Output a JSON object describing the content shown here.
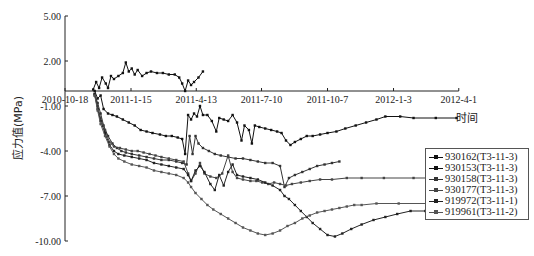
{
  "chart_data": {
    "type": "line",
    "title": "",
    "xlabel": "时间",
    "ylabel": "应力值(MPa)",
    "ylim": [
      -10,
      5
    ],
    "y_ticks": [
      "5.00",
      "2.00",
      "-1.00",
      "-4.00",
      "-7.00",
      "-10.00"
    ],
    "y_tick_values": [
      5,
      2,
      -1,
      -4,
      -7,
      -10
    ],
    "x_tick_labels": [
      "2010-10-18",
      "2011-1-15",
      "2011-4-13",
      "2011-7-10",
      "2011-10-7",
      "2012-1-3",
      "2012-4-1"
    ],
    "x_tick_days": [
      0,
      89,
      177,
      265,
      354,
      443,
      531
    ],
    "x_unit": "days since 2010-10-18",
    "grid": false,
    "legend_position": "right",
    "series": [
      {
        "name": "930162(T3-11-3)",
        "color": "#111111",
        "points": [
          [
            38,
            0.1
          ],
          [
            42,
            0.6
          ],
          [
            46,
            0.2
          ],
          [
            50,
            0.9
          ],
          [
            55,
            0.5
          ],
          [
            58,
            0.2
          ],
          [
            62,
            1.0
          ],
          [
            66,
            0.8
          ],
          [
            72,
            1.0
          ],
          [
            78,
            1.2
          ],
          [
            82,
            1.9
          ],
          [
            86,
            1.3
          ],
          [
            90,
            1.5
          ],
          [
            94,
            1.1
          ],
          [
            98,
            1.4
          ],
          [
            104,
            1.0
          ],
          [
            110,
            1.2
          ],
          [
            116,
            1.3
          ],
          [
            124,
            1.2
          ],
          [
            132,
            1.2
          ],
          [
            140,
            1.1
          ],
          [
            148,
            1.1
          ],
          [
            154,
            0.9
          ],
          [
            158,
            0.5
          ],
          [
            162,
            0.0
          ],
          [
            166,
            0.7
          ],
          [
            170,
            0.4
          ],
          [
            174,
            0.6
          ],
          [
            180,
            0.9
          ],
          [
            186,
            1.3
          ]
        ]
      },
      {
        "name": "930153(T3-11-3)",
        "color": "#111111",
        "points": [
          [
            40,
            0.0
          ],
          [
            44,
            -0.5
          ],
          [
            48,
            -0.3
          ],
          [
            52,
            -1.2
          ],
          [
            58,
            -1.5
          ],
          [
            64,
            -1.6
          ],
          [
            70,
            -1.7
          ],
          [
            78,
            -1.9
          ],
          [
            86,
            -2.1
          ],
          [
            94,
            -2.3
          ],
          [
            102,
            -2.6
          ],
          [
            110,
            -2.7
          ],
          [
            118,
            -2.8
          ],
          [
            128,
            -2.9
          ],
          [
            136,
            -3.0
          ],
          [
            144,
            -3.0
          ],
          [
            152,
            -3.1
          ],
          [
            158,
            -3.2
          ],
          [
            162,
            -4.2
          ],
          [
            166,
            -1.6
          ],
          [
            170,
            -1.9
          ],
          [
            174,
            -1.5
          ],
          [
            178,
            -1.7
          ],
          [
            182,
            -1.0
          ],
          [
            186,
            -1.6
          ],
          [
            192,
            -1.6
          ],
          [
            198,
            -2.0
          ],
          [
            204,
            -2.7
          ],
          [
            208,
            -1.8
          ],
          [
            214,
            -1.9
          ],
          [
            220,
            -2.0
          ],
          [
            226,
            -1.6
          ],
          [
            232,
            -2.1
          ],
          [
            238,
            -3.3
          ],
          [
            242,
            -2.3
          ],
          [
            248,
            -2.6
          ],
          [
            252,
            -3.5
          ],
          [
            256,
            -2.3
          ],
          [
            262,
            -2.4
          ],
          [
            270,
            -2.5
          ],
          [
            278,
            -2.6
          ],
          [
            286,
            -2.7
          ],
          [
            292,
            -2.8
          ],
          [
            298,
            -3.3
          ],
          [
            304,
            -3.6
          ],
          [
            310,
            -3.4
          ],
          [
            318,
            -3.2
          ],
          [
            326,
            -3.0
          ],
          [
            334,
            -3.0
          ],
          [
            344,
            -2.9
          ],
          [
            354,
            -2.8
          ],
          [
            366,
            -2.7
          ],
          [
            378,
            -2.5
          ],
          [
            392,
            -2.3
          ],
          [
            406,
            -2.1
          ],
          [
            420,
            -1.9
          ],
          [
            432,
            -1.7
          ],
          [
            452,
            -1.7
          ],
          [
            470,
            -1.8
          ],
          [
            500,
            -1.8
          ],
          [
            528,
            -1.8
          ]
        ]
      },
      {
        "name": "930158(T3-11-3)",
        "color": "#333333",
        "points": [
          [
            40,
            -0.2
          ],
          [
            44,
            -0.8
          ],
          [
            48,
            -1.5
          ],
          [
            52,
            -2.3
          ],
          [
            58,
            -3.0
          ],
          [
            64,
            -3.5
          ],
          [
            70,
            -3.8
          ],
          [
            76,
            -4.0
          ],
          [
            82,
            -4.1
          ],
          [
            90,
            -4.2
          ],
          [
            100,
            -4.3
          ],
          [
            110,
            -4.4
          ],
          [
            120,
            -4.5
          ],
          [
            130,
            -4.6
          ],
          [
            140,
            -4.6
          ],
          [
            150,
            -4.7
          ],
          [
            158,
            -4.8
          ],
          [
            164,
            -4.9
          ],
          [
            168,
            -3.0
          ],
          [
            172,
            -4.2
          ],
          [
            176,
            -3.0
          ],
          [
            180,
            -3.5
          ],
          [
            186,
            -3.8
          ],
          [
            194,
            -4.0
          ],
          [
            202,
            -4.2
          ],
          [
            210,
            -4.3
          ],
          [
            220,
            -4.4
          ],
          [
            230,
            -4.5
          ],
          [
            240,
            -4.5
          ],
          [
            250,
            -4.6
          ],
          [
            260,
            -4.7
          ],
          [
            270,
            -4.8
          ],
          [
            280,
            -4.8
          ],
          [
            290,
            -5.0
          ],
          [
            296,
            -6.4
          ],
          [
            302,
            -5.8
          ],
          [
            310,
            -5.6
          ],
          [
            320,
            -5.4
          ],
          [
            330,
            -5.2
          ],
          [
            340,
            -5.0
          ],
          [
            350,
            -4.9
          ],
          [
            360,
            -4.8
          ],
          [
            370,
            -4.7
          ]
        ]
      },
      {
        "name": "930177(T3-11-3)",
        "color": "#444444",
        "points": [
          [
            40,
            -0.3
          ],
          [
            44,
            -1.0
          ],
          [
            48,
            -1.8
          ],
          [
            54,
            -2.6
          ],
          [
            60,
            -3.4
          ],
          [
            66,
            -3.7
          ],
          [
            74,
            -3.8
          ],
          [
            82,
            -3.9
          ],
          [
            90,
            -4.0
          ],
          [
            98,
            -4.0
          ],
          [
            106,
            -4.1
          ],
          [
            114,
            -4.2
          ],
          [
            122,
            -4.3
          ],
          [
            130,
            -4.4
          ],
          [
            140,
            -4.5
          ],
          [
            150,
            -4.6
          ],
          [
            160,
            -4.7
          ],
          [
            166,
            -5.5
          ],
          [
            170,
            -6.0
          ],
          [
            176,
            -5.5
          ],
          [
            182,
            -4.8
          ],
          [
            188,
            -5.5
          ],
          [
            196,
            -5.7
          ],
          [
            204,
            -5.8
          ],
          [
            212,
            -5.5
          ],
          [
            220,
            -4.3
          ],
          [
            226,
            -5.4
          ],
          [
            232,
            -5.8
          ],
          [
            240,
            -5.9
          ],
          [
            250,
            -6.0
          ],
          [
            258,
            -6.0
          ],
          [
            266,
            -6.1
          ],
          [
            274,
            -6.2
          ],
          [
            282,
            -6.1
          ],
          [
            290,
            -6.2
          ],
          [
            298,
            -6.3
          ],
          [
            306,
            -6.2
          ],
          [
            318,
            -6.1
          ],
          [
            330,
            -6.0
          ],
          [
            344,
            -5.9
          ],
          [
            360,
            -5.9
          ],
          [
            380,
            -5.8
          ],
          [
            400,
            -5.8
          ],
          [
            430,
            -5.8
          ],
          [
            470,
            -5.8
          ],
          [
            528,
            -5.8
          ]
        ]
      },
      {
        "name": "919972(T3-11-1)",
        "color": "#222222",
        "points": [
          [
            40,
            -0.2
          ],
          [
            44,
            -1.2
          ],
          [
            48,
            -2.0
          ],
          [
            54,
            -2.8
          ],
          [
            60,
            -3.6
          ],
          [
            66,
            -4.0
          ],
          [
            72,
            -4.2
          ],
          [
            80,
            -4.3
          ],
          [
            90,
            -4.4
          ],
          [
            100,
            -4.5
          ],
          [
            110,
            -4.6
          ],
          [
            120,
            -4.8
          ],
          [
            130,
            -4.9
          ],
          [
            140,
            -5.0
          ],
          [
            150,
            -5.1
          ],
          [
            160,
            -5.2
          ],
          [
            166,
            -5.6
          ],
          [
            170,
            -6.0
          ],
          [
            176,
            -5.3
          ],
          [
            182,
            -5.0
          ],
          [
            188,
            -5.4
          ],
          [
            196,
            -6.2
          ],
          [
            202,
            -6.6
          ],
          [
            208,
            -5.6
          ],
          [
            214,
            -6.3
          ],
          [
            220,
            -5.4
          ],
          [
            226,
            -4.9
          ],
          [
            232,
            -5.6
          ],
          [
            240,
            -5.7
          ],
          [
            250,
            -5.8
          ],
          [
            260,
            -5.9
          ],
          [
            270,
            -6.1
          ],
          [
            280,
            -6.3
          ],
          [
            290,
            -6.6
          ],
          [
            296,
            -7.0
          ],
          [
            302,
            -7.2
          ],
          [
            310,
            -7.6
          ],
          [
            318,
            -8.0
          ],
          [
            326,
            -8.4
          ],
          [
            334,
            -8.8
          ],
          [
            344,
            -9.2
          ],
          [
            354,
            -9.6
          ],
          [
            364,
            -9.7
          ],
          [
            374,
            -9.5
          ],
          [
            386,
            -9.2
          ],
          [
            400,
            -8.9
          ],
          [
            416,
            -8.6
          ],
          [
            432,
            -8.4
          ],
          [
            448,
            -8.2
          ],
          [
            466,
            -8.0
          ],
          [
            486,
            -8.0
          ],
          [
            508,
            -8.0
          ],
          [
            528,
            -8.0
          ]
        ]
      },
      {
        "name": "919961(T3-11-2)",
        "color": "#555555",
        "points": [
          [
            40,
            -0.3
          ],
          [
            44,
            -1.3
          ],
          [
            48,
            -2.2
          ],
          [
            54,
            -3.0
          ],
          [
            60,
            -3.7
          ],
          [
            66,
            -4.2
          ],
          [
            72,
            -4.5
          ],
          [
            80,
            -4.7
          ],
          [
            90,
            -4.9
          ],
          [
            100,
            -5.0
          ],
          [
            110,
            -5.1
          ],
          [
            120,
            -5.3
          ],
          [
            130,
            -5.4
          ],
          [
            140,
            -5.5
          ],
          [
            150,
            -5.6
          ],
          [
            160,
            -5.8
          ],
          [
            166,
            -6.1
          ],
          [
            170,
            -6.4
          ],
          [
            176,
            -6.8
          ],
          [
            184,
            -7.2
          ],
          [
            192,
            -7.6
          ],
          [
            200,
            -7.9
          ],
          [
            210,
            -8.2
          ],
          [
            220,
            -8.5
          ],
          [
            230,
            -8.8
          ],
          [
            240,
            -9.1
          ],
          [
            250,
            -9.3
          ],
          [
            260,
            -9.5
          ],
          [
            270,
            -9.6
          ],
          [
            280,
            -9.5
          ],
          [
            290,
            -9.3
          ],
          [
            300,
            -9.0
          ],
          [
            310,
            -8.8
          ],
          [
            320,
            -8.5
          ],
          [
            330,
            -8.3
          ],
          [
            340,
            -8.1
          ],
          [
            350,
            -8.0
          ],
          [
            360,
            -7.9
          ],
          [
            370,
            -7.8
          ],
          [
            380,
            -7.7
          ],
          [
            390,
            -7.6
          ],
          [
            400,
            -7.6
          ],
          [
            420,
            -7.5
          ],
          [
            450,
            -7.5
          ],
          [
            490,
            -7.5
          ],
          [
            528,
            -7.5
          ]
        ]
      }
    ]
  }
}
